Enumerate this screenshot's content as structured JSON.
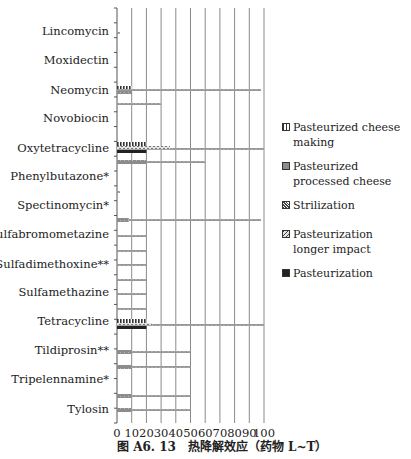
{
  "chart_data": {
    "type": "bar",
    "orientation": "horizontal",
    "title": "",
    "caption": "图 A6. 13　热降解效应（药物 L~T）",
    "xlabel": "",
    "ylabel": "",
    "xlim": [
      0,
      100
    ],
    "xticks": [
      0,
      10,
      20,
      30,
      40,
      50,
      60,
      70,
      80,
      90,
      100
    ],
    "grid": "vertical",
    "legend_position": "right",
    "categories": [
      "Lincomycin",
      "Moxidectin",
      "Neomycin",
      "Novobiocin",
      "Oxytetracycline",
      "Phenylbutazone*",
      "Spectinomycin*",
      "Sulfabromometazine",
      "Sulfadimethoxine**",
      "Sulfamethazine",
      "Tetracycline",
      "Tildiprosin**",
      "Tripelennamine*",
      "Tylosin"
    ],
    "series": [
      {
        "name": "Pasteurized cheese making",
        "pattern": "vbars",
        "values": [
          0,
          0,
          10,
          0,
          20,
          20,
          0,
          8,
          0,
          0,
          20,
          10,
          10,
          10
        ]
      },
      {
        "name": "Pasteurized processed cheese",
        "pattern": "gray",
        "values": [
          0,
          0,
          10,
          0,
          20,
          20,
          0,
          8,
          0,
          0,
          20,
          10,
          10,
          10
        ]
      },
      {
        "name": "Strilization",
        "pattern": "zigzag",
        "values": [
          2,
          0,
          98,
          30,
          100,
          60,
          2,
          98,
          20,
          20,
          100,
          50,
          50,
          50
        ]
      },
      {
        "name": "Pasteurization longer impact",
        "pattern": "dotted",
        "values": [
          0,
          0,
          0,
          0,
          36,
          0,
          0,
          0,
          0,
          0,
          24,
          0,
          0,
          0
        ]
      },
      {
        "name": "Pasteurization",
        "pattern": "solid",
        "values": [
          0,
          0,
          10,
          0,
          20,
          0,
          0,
          0,
          0,
          0,
          20,
          0,
          0,
          0
        ]
      }
    ],
    "row_values": {
      "Lincomycin": {
        "Strilization": 2
      },
      "Moxidectin": {},
      "Neomycin": {
        "Pasteurized cheese making": 10,
        "Pasteurized processed cheese": 10,
        "Strilization": 98,
        "Strilization_second": 30
      },
      "Novobiocin": {},
      "Oxytetracycline": {
        "Pasteurized cheese making": 20,
        "Pasteurization longer impact": 36,
        "Strilization": 100,
        "Pasteurization": 20,
        "Pasteurized processed cheese": 20,
        "Strilization_second": 60
      },
      "Phenylbutazone*": {},
      "Spectinomycin*": {
        "Strilization": 2,
        "Pasteurized processed cheese": 8,
        "Strilization_second": 98
      },
      "Sulfabromometazine": {
        "Strilization": 20,
        "Strilization_second": 20
      },
      "Sulfadimethoxine**": {
        "Strilization": 20,
        "Strilization_second": 20
      },
      "Sulfamethazine": {
        "Strilization": 20,
        "Strilization_second": 20
      },
      "Tetracycline": {
        "Pasteurized cheese making": 20,
        "Pasteurization longer impact": 24,
        "Strilization": 100,
        "Pasteurization": 20
      },
      "Tildiprosin**": {
        "Pasteurized processed cheese": 10,
        "Strilization": 50,
        "Strilization_second": 50
      },
      "Tripelennamine*": {},
      "Tylosin": {
        "Pasteurized processed cheese": 10,
        "Strilization": 50,
        "Strilization_second": 50
      }
    }
  },
  "bars": [
    {
      "y": 32,
      "h": 2,
      "x0": 0,
      "x1": 2,
      "pattern": "zigzag"
    },
    {
      "y": 86,
      "h": 3,
      "x0": 0,
      "x1": 10,
      "pattern": "vbars"
    },
    {
      "y": 89,
      "h": 2,
      "x0": 0,
      "x1": 98,
      "pattern": "zigzag"
    },
    {
      "y": 91,
      "h": 3,
      "x0": 0,
      "x1": 10,
      "pattern": "gray"
    },
    {
      "y": 103,
      "h": 2,
      "x0": 0,
      "x1": 30,
      "pattern": "zigzag"
    },
    {
      "y": 142,
      "h": 4,
      "x0": 0,
      "x1": 20,
      "pattern": "vbars"
    },
    {
      "y": 146,
      "h": 4,
      "x0": 0,
      "x1": 36,
      "pattern": "dotted"
    },
    {
      "y": 148,
      "h": 2,
      "x0": 36,
      "x1": 100,
      "pattern": "zigzag"
    },
    {
      "y": 150,
      "h": 3,
      "x0": 0,
      "x1": 20,
      "pattern": "solid"
    },
    {
      "y": 160,
      "h": 4,
      "x0": 0,
      "x1": 20,
      "pattern": "gray"
    },
    {
      "y": 161,
      "h": 2,
      "x0": 20,
      "x1": 60,
      "pattern": "zigzag"
    },
    {
      "y": 191,
      "h": 2,
      "x0": 0,
      "x1": 2,
      "pattern": "zigzag"
    },
    {
      "y": 218,
      "h": 4,
      "x0": 0,
      "x1": 8,
      "pattern": "gray"
    },
    {
      "y": 219,
      "h": 2,
      "x0": 8,
      "x1": 98,
      "pattern": "zigzag"
    },
    {
      "y": 235,
      "h": 2,
      "x0": 0,
      "x1": 20,
      "pattern": "zigzag"
    },
    {
      "y": 250,
      "h": 2,
      "x0": 0,
      "x1": 20,
      "pattern": "zigzag"
    },
    {
      "y": 264,
      "h": 2,
      "x0": 0,
      "x1": 20,
      "pattern": "zigzag"
    },
    {
      "y": 279,
      "h": 2,
      "x0": 0,
      "x1": 20,
      "pattern": "zigzag"
    },
    {
      "y": 293,
      "h": 2,
      "x0": 0,
      "x1": 20,
      "pattern": "zigzag"
    },
    {
      "y": 308,
      "h": 2,
      "x0": 0,
      "x1": 20,
      "pattern": "zigzag"
    },
    {
      "y": 319,
      "h": 4,
      "x0": 0,
      "x1": 20,
      "pattern": "vbars"
    },
    {
      "y": 323,
      "h": 3,
      "x0": 0,
      "x1": 24,
      "pattern": "dotted"
    },
    {
      "y": 324,
      "h": 2,
      "x0": 24,
      "x1": 100,
      "pattern": "zigzag"
    },
    {
      "y": 326,
      "h": 3,
      "x0": 0,
      "x1": 20,
      "pattern": "solid"
    },
    {
      "y": 350,
      "h": 4,
      "x0": 0,
      "x1": 10,
      "pattern": "gray"
    },
    {
      "y": 351,
      "h": 2,
      "x0": 10,
      "x1": 50,
      "pattern": "zigzag"
    },
    {
      "y": 365,
      "h": 4,
      "x0": 0,
      "x1": 10,
      "pattern": "gray"
    },
    {
      "y": 366,
      "h": 2,
      "x0": 10,
      "x1": 50,
      "pattern": "zigzag"
    },
    {
      "y": 394,
      "h": 4,
      "x0": 0,
      "x1": 10,
      "pattern": "gray"
    },
    {
      "y": 395,
      "h": 2,
      "x0": 10,
      "x1": 50,
      "pattern": "zigzag"
    },
    {
      "y": 408,
      "h": 4,
      "x0": 0,
      "x1": 10,
      "pattern": "gray"
    },
    {
      "y": 409,
      "h": 2,
      "x0": 10,
      "x1": 50,
      "pattern": "zigzag"
    }
  ],
  "category_label_y": [
    31,
    60,
    90,
    118,
    148,
    176,
    205,
    234,
    264,
    292,
    321,
    350,
    379,
    409
  ],
  "legend": [
    {
      "label": "Pasteurized cheese making",
      "pattern": "vbars"
    },
    {
      "label": "Pasteurized processed cheese",
      "pattern": "gray"
    },
    {
      "label": "Strilization",
      "pattern": "zigzag"
    },
    {
      "label": "Pasteurization longer impact",
      "pattern": "dotted",
      "gap": true
    },
    {
      "label": "Pasteurization",
      "pattern": "solid"
    }
  ],
  "colors": {
    "axis": "#555555",
    "grid": "#8a8a8a",
    "text": "#222222",
    "solid": "#222222",
    "gray": "#8c8c8c",
    "zigzag": "#555555"
  }
}
